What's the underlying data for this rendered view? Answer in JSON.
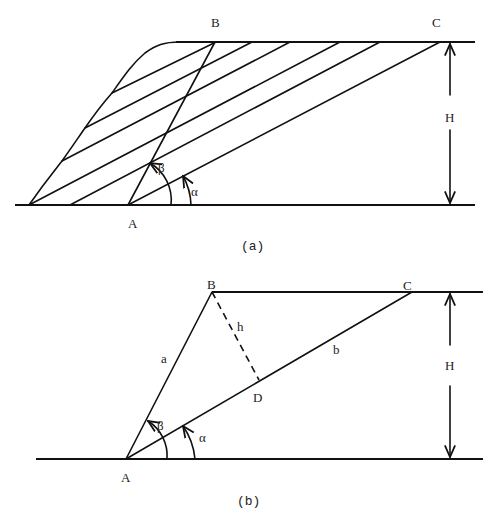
{
  "diagram_a": {
    "caption": "(a)",
    "labels": {
      "B": "B",
      "C": "C",
      "A": "A",
      "H": "H",
      "alpha": "α",
      "beta": "β"
    }
  },
  "diagram_b": {
    "caption": "(b)",
    "labels": {
      "A": "A",
      "B": "B",
      "C": "C",
      "D": "D",
      "H": "H",
      "a": "a",
      "b": "b",
      "h": "h",
      "alpha": "α",
      "beta": "β"
    }
  },
  "colors": {
    "stroke": "#111111",
    "background": "#ffffff"
  }
}
